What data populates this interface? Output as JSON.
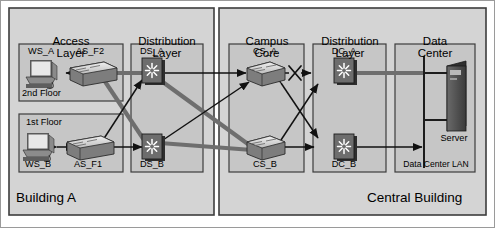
{
  "diagram": {
    "title_building_a": "Building A",
    "title_central_building": "Central Building",
    "type": "network-topology",
    "colors": {
      "panel_fill": "#d4d4d4",
      "panel_fill_inner": "#c6c6c6",
      "panel_stroke": "#3c3c3c",
      "page_bg": "#ffffff",
      "link_thick": "#6e6e6e",
      "link_thin": "#1a1a1a",
      "switch_body": "#6b6b6b",
      "switch_top": "#d8d8d8",
      "device_dark": "#4a4a4a"
    },
    "buildings": [
      {
        "id": "building-a",
        "label": "Building A"
      },
      {
        "id": "central-building",
        "label": "Central Building"
      }
    ],
    "groups": [
      {
        "id": "access-layer",
        "label": "Access\nLayer",
        "line1": "Access",
        "line2": "Layer"
      },
      {
        "id": "distribution-layer-a",
        "label": "Distribution\nLayer",
        "line1": "Distribution",
        "line2": "Layer"
      },
      {
        "id": "campus-core",
        "label": "Campus\nCore",
        "line1": "Campus",
        "line2": "Core"
      },
      {
        "id": "distribution-layer-b",
        "label": "Distribution\nLayer",
        "line1": "Distribution",
        "line2": "Layer"
      },
      {
        "id": "data-center",
        "label": "Data\nCenter",
        "line1": "Data",
        "line2": "Center"
      }
    ],
    "nodes": [
      {
        "id": "ws-a",
        "label": "WS_A",
        "type": "workstation",
        "group": "access-layer"
      },
      {
        "id": "ws-b",
        "label": "WS_B",
        "type": "workstation",
        "group": "access-layer"
      },
      {
        "id": "as-f2",
        "label": "AS_F2",
        "type": "switch",
        "group": "access-layer"
      },
      {
        "id": "as-f1",
        "label": "AS_F1",
        "type": "switch",
        "group": "access-layer"
      },
      {
        "id": "ds-a",
        "label": "DS_A",
        "type": "multilayer-switch",
        "group": "distribution-layer-a"
      },
      {
        "id": "ds-b",
        "label": "DS_B",
        "type": "multilayer-switch",
        "group": "distribution-layer-a"
      },
      {
        "id": "cs-a",
        "label": "CS_A",
        "type": "switch",
        "group": "campus-core"
      },
      {
        "id": "cs-b",
        "label": "CS_B",
        "type": "switch",
        "group": "campus-core"
      },
      {
        "id": "dc-a",
        "label": "DC_A",
        "type": "multilayer-switch",
        "group": "distribution-layer-b"
      },
      {
        "id": "dc-b",
        "label": "DC_B",
        "type": "multilayer-switch",
        "group": "distribution-layer-b"
      },
      {
        "id": "server",
        "label": "Server",
        "type": "server",
        "group": "data-center"
      }
    ],
    "floors": [
      {
        "id": "floor-2",
        "label": "2nd Floor"
      },
      {
        "id": "floor-1",
        "label": "1st Floor"
      }
    ],
    "lan_label": "Data Center LAN",
    "links": [
      {
        "id": "link-wsa-asf2",
        "from": "as-f2",
        "to": "ws-a",
        "style": "thin",
        "arrows": "to"
      },
      {
        "id": "link-wsb-asf1",
        "from": "ws-b",
        "to": "as-f1",
        "style": "thin",
        "arrows": "both"
      },
      {
        "id": "link-asf2-dsa",
        "from": "as-f2",
        "to": "ds-a",
        "style": "thick",
        "arrows": "none"
      },
      {
        "id": "link-asf2-dsb",
        "from": "as-f2",
        "to": "ds-b",
        "style": "thick",
        "arrows": "none"
      },
      {
        "id": "link-asf1-dsa",
        "from": "as-f1",
        "to": "ds-a",
        "style": "thin",
        "arrows": "both"
      },
      {
        "id": "link-asf1-dsb",
        "from": "as-f1",
        "to": "ds-b",
        "style": "thin",
        "arrows": "both"
      },
      {
        "id": "link-dsa-csa",
        "from": "ds-a",
        "to": "cs-a",
        "style": "thin",
        "arrows": "both"
      },
      {
        "id": "link-dsa-csb",
        "from": "ds-a",
        "to": "cs-b",
        "style": "thick",
        "arrows": "none"
      },
      {
        "id": "link-dsb-csa",
        "from": "ds-b",
        "to": "cs-a",
        "style": "thin",
        "arrows": "both"
      },
      {
        "id": "link-dsb-csb",
        "from": "ds-b",
        "to": "cs-b",
        "style": "thick",
        "arrows": "none"
      },
      {
        "id": "link-csa-dca",
        "from": "cs-a",
        "to": "dc-a",
        "style": "thin",
        "arrows": "both",
        "broken": true
      },
      {
        "id": "link-csa-dcb",
        "from": "cs-a",
        "to": "dc-b",
        "style": "thin",
        "arrows": "both"
      },
      {
        "id": "link-csb-dca",
        "from": "cs-b",
        "to": "dc-a",
        "style": "thin",
        "arrows": "both"
      },
      {
        "id": "link-csb-dcb",
        "from": "cs-b",
        "to": "dc-b",
        "style": "thin",
        "arrows": "both"
      },
      {
        "id": "link-dca-lan",
        "from": "dc-a",
        "to": "lan",
        "style": "thick",
        "arrows": "none"
      },
      {
        "id": "link-dcb-lan",
        "from": "dc-b",
        "to": "lan",
        "style": "thin",
        "arrows": "both"
      },
      {
        "id": "link-lan-server",
        "from": "lan",
        "to": "server",
        "style": "thin",
        "arrows": "none"
      }
    ],
    "markers": [
      {
        "id": "broken-link-x",
        "label": "X",
        "on_link": "link-csa-dca"
      }
    ]
  }
}
